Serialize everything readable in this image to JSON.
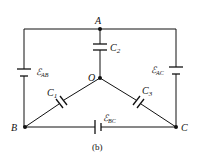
{
  "figure": {
    "caption": "(b)",
    "nodes": {
      "A": {
        "label": "A"
      },
      "O": {
        "label": "O"
      },
      "B": {
        "label": "B"
      },
      "C": {
        "label": "C"
      }
    },
    "capacitors": [
      {
        "name": "C",
        "sub": "2",
        "between": "A-O"
      },
      {
        "name": "C",
        "sub": "1",
        "between": "O-B"
      },
      {
        "name": "C",
        "sub": "3",
        "between": "O-C"
      }
    ],
    "sources": [
      {
        "symbol": "ℰ",
        "sub": "AB",
        "between": "A-B"
      },
      {
        "symbol": "ℰ",
        "sub": "AC",
        "between": "A-C"
      },
      {
        "symbol": "ℰ",
        "sub": "BC",
        "between": "B-C"
      }
    ],
    "colors": {
      "ink": "#111111",
      "background": "#ffffff"
    }
  }
}
